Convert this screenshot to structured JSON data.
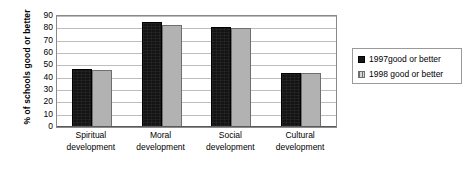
{
  "chart_data": {
    "type": "bar",
    "title": "",
    "xlabel": "",
    "ylabel": "% of schools good or better",
    "ylim": [
      0,
      90
    ],
    "ytick_step": 10,
    "yticks": [
      90,
      80,
      70,
      60,
      50,
      40,
      30,
      20,
      10,
      0
    ],
    "grid": true,
    "legend_position": "right",
    "categories": [
      "Spiritual development",
      "Moral development",
      "Social development",
      "Cultural development"
    ],
    "category_lines": [
      [
        "Spiritual",
        "development"
      ],
      [
        "Moral",
        "development"
      ],
      [
        "Social",
        "development"
      ],
      [
        "Cultural",
        "development"
      ]
    ],
    "series": [
      {
        "name": "1997good or better",
        "color": "#141414",
        "values": [
          47,
          85,
          81,
          44
        ]
      },
      {
        "name": "1998 good or better",
        "color": "#b2b2b2",
        "values": [
          46,
          83,
          80,
          43.5
        ]
      }
    ]
  },
  "legend": {
    "items": [
      {
        "label": "1997good or better"
      },
      {
        "label": "1998 good or better"
      }
    ]
  },
  "colors": {
    "series_1997": "#141414",
    "series_1998": "#b2b2b2",
    "gridline": "#bdbdbd",
    "axis": "#8a8a8a",
    "background": "#ffffff"
  }
}
